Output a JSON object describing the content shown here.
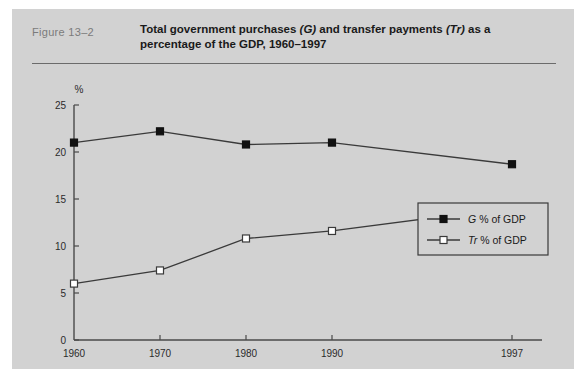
{
  "figure": {
    "number_label": "Figure  13–2",
    "title_line1_a": "Total government purchases ",
    "title_line1_sym1": "(G)",
    "title_line1_b": " and transfer payments ",
    "title_line1_sym2": "(Tr)",
    "title_line1_c": " as a",
    "title_line2": "percentage of the GDP, 1960–1997"
  },
  "colors": {
    "panel_background": "#d2d2d2",
    "page_background": "#ffffff",
    "axis": "#4a4a4a",
    "series_line": "#3a3a3a",
    "marker_filled": "#111111",
    "marker_open_fill": "#ffffff",
    "figure_number_text": "#7b7b7b",
    "title_text": "#1a1a1a",
    "rule": "#6b6b6b"
  },
  "chart_data": {
    "type": "line",
    "title": "Total government purchases (G) and transfer payments (Tr) as a percentage of the GDP, 1960–1997",
    "xlabel": "",
    "ylabel": "",
    "y_unit_label": "%",
    "categories": [
      "1960",
      "1970",
      "1980",
      "1990",
      "1997"
    ],
    "x": [
      1960,
      1970,
      1980,
      1990,
      1997
    ],
    "xlim": [
      1960,
      1997
    ],
    "ylim": [
      0,
      25
    ],
    "yticks": [
      0,
      5,
      10,
      15,
      20,
      25
    ],
    "ytick_labels": [
      "0",
      "5",
      "10",
      "15",
      "20",
      "25"
    ],
    "xtick_labels": [
      "1960",
      "1970",
      "1980",
      "1990",
      "1997"
    ],
    "grid": false,
    "legend_position": "center-right",
    "series": [
      {
        "name": "G % of GDP",
        "legend_symbol": "G",
        "legend_suffix": "% of GDP",
        "marker": "filled-square",
        "values": [
          21.0,
          22.2,
          20.8,
          21.0,
          18.7
        ]
      },
      {
        "name": "Tr % of GDP",
        "legend_symbol": "Tr",
        "legend_suffix": "% of GDP",
        "marker": "open-square",
        "values": [
          6.0,
          7.4,
          10.8,
          11.6,
          14.1
        ]
      }
    ]
  }
}
